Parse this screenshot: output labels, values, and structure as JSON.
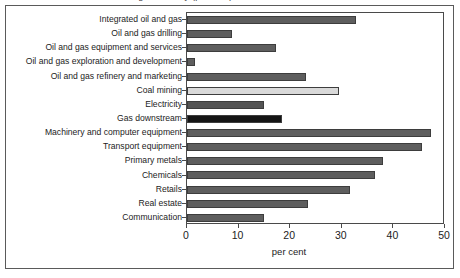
{
  "figure": {
    "cropped_title": "and gas industry (per cent)"
  },
  "chart_data": {
    "type": "bar",
    "orientation": "horizontal",
    "title": "",
    "xlabel": "per cent",
    "ylabel": "",
    "xlim": [
      0,
      50
    ],
    "xticks": [
      0,
      10,
      20,
      30,
      40,
      50
    ],
    "grid": false,
    "legend": "none",
    "categories": [
      "Integrated oil and gas",
      "Oil and gas drilling",
      "Oil and gas equipment and services",
      "Oil and gas exploration and development",
      "Oil and gas refinery and marketing",
      "Coal mining",
      "Electricity",
      "Gas downstream",
      "Machinery and computer equipment",
      "Transport equipment",
      "Primary metals",
      "Chemicals",
      "Retails",
      "Real estate",
      "Communication"
    ],
    "values": [
      32.7,
      8.8,
      17.3,
      1.5,
      23.0,
      29.4,
      15.0,
      18.5,
      47.3,
      45.5,
      38.0,
      36.5,
      31.5,
      23.5,
      15.0
    ],
    "bar_colors": [
      "#5e5e5e",
      "#5e5e5e",
      "#5e5e5e",
      "#5e5e5e",
      "#5e5e5e",
      "#d9d9d9",
      "#545454",
      "#151515",
      "#5e5e5e",
      "#5e5e5e",
      "#5e5e5e",
      "#5e5e5e",
      "#5e5e5e",
      "#5e5e5e",
      "#5e5e5e"
    ],
    "axis_color": "#4a4a4a",
    "bar_edge_color": "#3d3d3d",
    "background": "#ffffff"
  }
}
